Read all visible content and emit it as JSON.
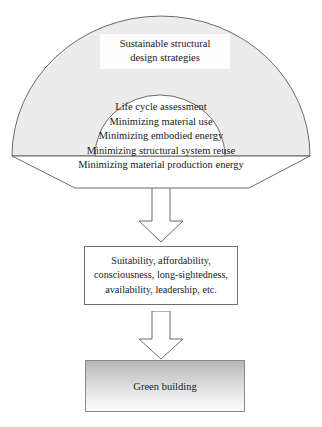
{
  "diagram": {
    "title_box": {
      "lines": [
        "Sustainable structural",
        "design strategies"
      ]
    },
    "strategies": [
      "Life cycle assessment",
      "Minimizing material use",
      "Minimizing embodied energy",
      "Minimizing structural system reuse",
      "Minimizing material production energy"
    ],
    "qualities_box": {
      "lines": [
        "Suitability, affordability,",
        "consciousness, long-sightedness,",
        "availability, leadership, etc."
      ]
    },
    "outcome_box": {
      "label": "Green building"
    },
    "connectors": [
      {
        "name": "arrow-strategies-to-qualities",
        "direction": "down"
      },
      {
        "name": "arrow-qualities-to-outcome",
        "direction": "down"
      }
    ],
    "colors": {
      "fan_fill": "#ececec",
      "fan_stroke": "#5a5a5a",
      "inner_fill": "#ffffff",
      "box_stroke": "#6e6e6e",
      "arrow_fill": "#ffffff",
      "arrow_stroke": "#6b6b6b",
      "outcome_gradient_top": "#b6b6b6",
      "outcome_gradient_bottom": "#fcfcfc",
      "text": "#1a1a1a"
    }
  }
}
